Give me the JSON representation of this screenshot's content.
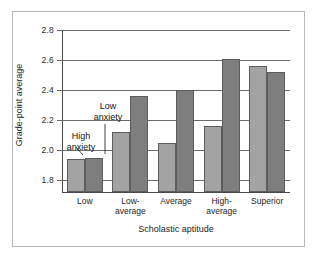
{
  "chart_data": {
    "type": "bar",
    "title": "",
    "xlabel": "Scholastic aptitude",
    "ylabel": "Grade-point average",
    "categories": [
      "Low",
      "Low-\naverage",
      "Average",
      "High-\naverage",
      "Superior"
    ],
    "category_labels_plain": [
      "Low",
      "Low-average",
      "Average",
      "High-average",
      "Superior"
    ],
    "series": [
      {
        "name": "High anxiety",
        "color": "#a3a3a3",
        "values": [
          1.94,
          2.12,
          2.05,
          2.16,
          2.56
        ]
      },
      {
        "name": "Low anxiety",
        "color": "#7e7e7e",
        "values": [
          1.95,
          2.36,
          2.4,
          2.61,
          2.52
        ]
      }
    ],
    "ylim": [
      1.72,
      2.8
    ],
    "yticks": [
      "2.8",
      "2.6",
      "2.4",
      "2.2",
      "2.0",
      "1.8"
    ],
    "ytick_values": [
      2.8,
      2.6,
      2.4,
      2.2,
      2.0,
      1.8
    ],
    "grid": true,
    "legend_position": "annotations-inline",
    "annotations": [
      {
        "name": "high-anxiety",
        "text": "High\nanxiety"
      },
      {
        "name": "low-anxiety",
        "text": "Low\nanxiety"
      }
    ]
  },
  "annotations": {
    "high_anxiety": "High\nanxiety",
    "low_anxiety": "Low\nanxiety"
  },
  "axes": {
    "x_title": "Scholastic aptitude",
    "y_title": "Grade-point average"
  },
  "colors": {
    "high_anxiety_bar": "#a3a3a3",
    "low_anxiety_bar": "#7e7e7e",
    "gridline": "#6b6b6b",
    "frame": "#b9b9b9",
    "background": "#ffffff"
  }
}
